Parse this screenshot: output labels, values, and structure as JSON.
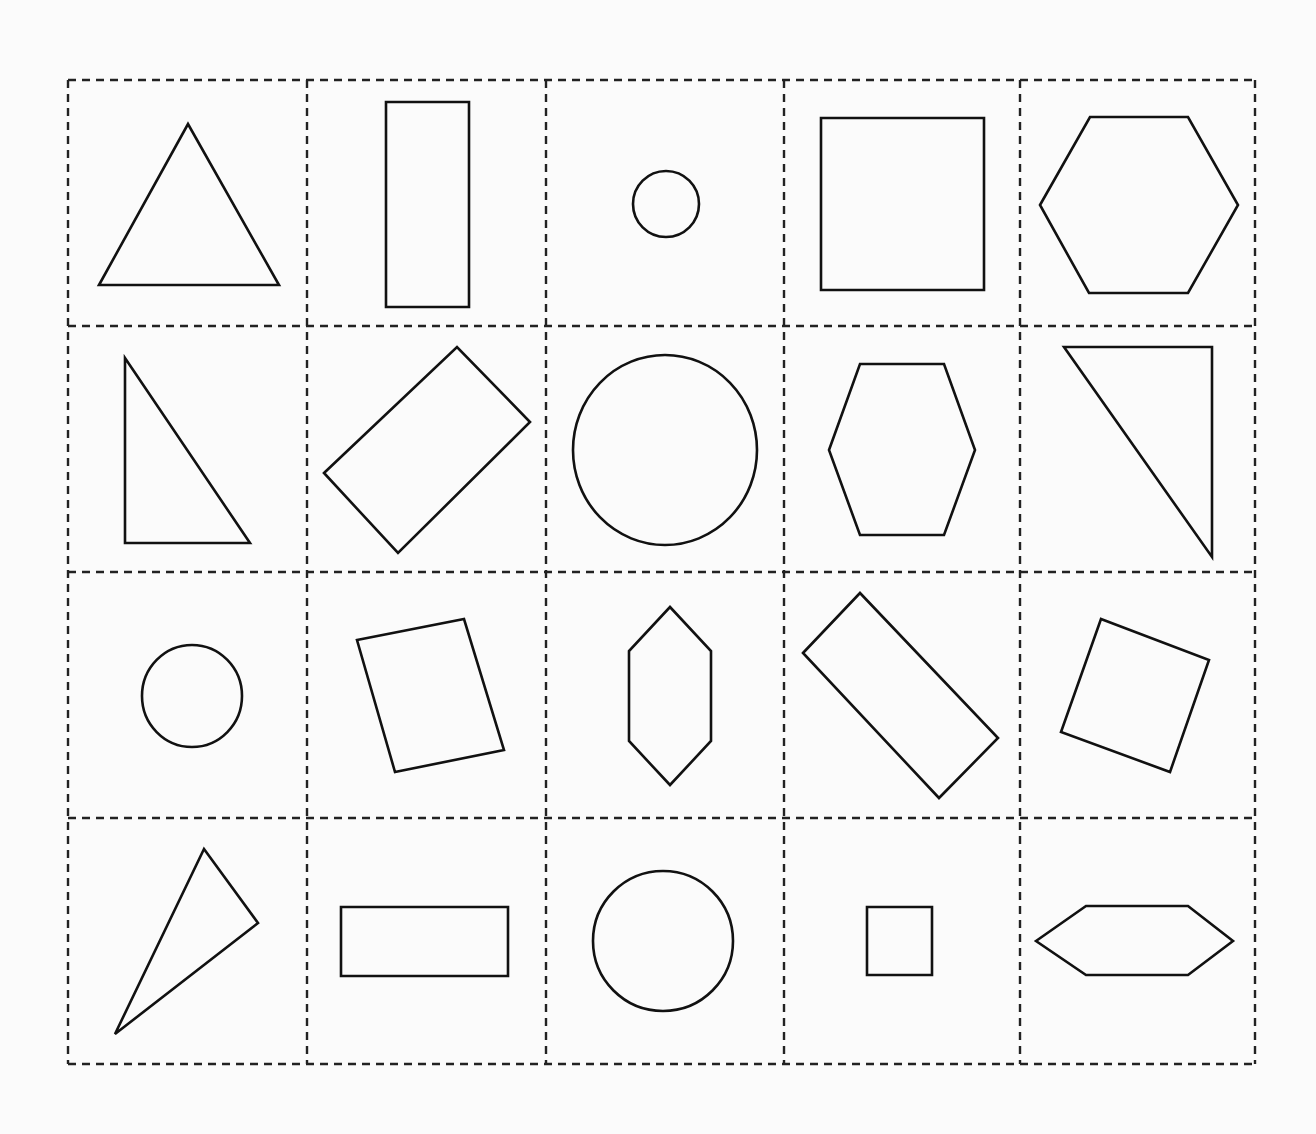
{
  "worksheet": {
    "grid": {
      "rows": 4,
      "cols": 5,
      "bounds": {
        "left": 68,
        "top": 80,
        "right": 1255,
        "bottom": 1064
      },
      "col_dividers": [
        68,
        307,
        546,
        784,
        1020,
        1255
      ],
      "row_dividers": [
        80,
        326,
        572,
        818,
        1064
      ],
      "line_color": "#222222",
      "line_style": "dashed"
    },
    "shape_color": "#111111",
    "cells": [
      {
        "row": 0,
        "col": 0,
        "shape": "triangle",
        "type": "polygon",
        "points": "99,285 188,124 279,285"
      },
      {
        "row": 0,
        "col": 1,
        "shape": "rectangle",
        "type": "polygon",
        "points": "386,102 469,102 469,307 386,307"
      },
      {
        "row": 0,
        "col": 2,
        "shape": "circle",
        "type": "ellipse",
        "cx": 666,
        "cy": 204,
        "rx": 33,
        "ry": 33
      },
      {
        "row": 0,
        "col": 3,
        "shape": "square",
        "type": "polygon",
        "points": "821,118 984,118 984,290 821,290"
      },
      {
        "row": 0,
        "col": 4,
        "shape": "hexagon",
        "type": "polygon",
        "points": "1040,205 1090,117 1188,117 1238,205 1188,293 1089,293"
      },
      {
        "row": 1,
        "col": 0,
        "shape": "triangle",
        "type": "polygon",
        "points": "125,358 125,543 250,543"
      },
      {
        "row": 1,
        "col": 1,
        "shape": "rectangle",
        "type": "polygon",
        "points": "324,473 457,347 530,422 398,553"
      },
      {
        "row": 1,
        "col": 2,
        "shape": "circle",
        "type": "ellipse",
        "cx": 665,
        "cy": 450,
        "rx": 92,
        "ry": 95
      },
      {
        "row": 1,
        "col": 3,
        "shape": "hexagon",
        "type": "polygon",
        "points": "829,450 860,364 944,364 975,450 944,535 860,535"
      },
      {
        "row": 1,
        "col": 4,
        "shape": "triangle",
        "type": "polygon",
        "points": "1064,347 1212,347 1212,557"
      },
      {
        "row": 2,
        "col": 0,
        "shape": "circle",
        "type": "ellipse",
        "cx": 192,
        "cy": 696,
        "rx": 50,
        "ry": 51
      },
      {
        "row": 2,
        "col": 1,
        "shape": "square",
        "type": "polygon",
        "points": "357,640 464,619 504,750 395,772"
      },
      {
        "row": 2,
        "col": 2,
        "shape": "hexagon",
        "type": "polygon",
        "points": "670,607 711,651 711,741 670,785 629,741 629,651"
      },
      {
        "row": 2,
        "col": 3,
        "shape": "rectangle",
        "type": "polygon",
        "points": "803,653 860,593 998,738 939,798"
      },
      {
        "row": 2,
        "col": 4,
        "shape": "square",
        "type": "polygon",
        "points": "1101,619 1209,660 1170,772 1061,732"
      },
      {
        "row": 3,
        "col": 0,
        "shape": "triangle",
        "type": "polygon",
        "points": "204,849 258,923 115,1034"
      },
      {
        "row": 3,
        "col": 1,
        "shape": "rectangle",
        "type": "polygon",
        "points": "341,907 508,907 508,976 341,976"
      },
      {
        "row": 3,
        "col": 2,
        "shape": "circle",
        "type": "ellipse",
        "cx": 663,
        "cy": 941,
        "rx": 70,
        "ry": 70
      },
      {
        "row": 3,
        "col": 3,
        "shape": "square",
        "type": "polygon",
        "points": "867,907 932,907 932,975 867,975"
      },
      {
        "row": 3,
        "col": 4,
        "shape": "hexagon",
        "type": "polygon",
        "points": "1036,941 1086,906 1188,906 1233,941 1188,975 1086,975"
      }
    ]
  }
}
